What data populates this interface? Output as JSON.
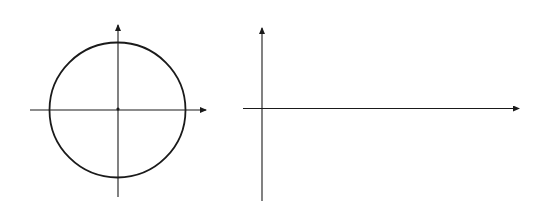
{
  "diagram": {
    "type": "unit-circle-to-wave",
    "colors": {
      "ink": "#1a1a1a",
      "background": "#ffffff"
    },
    "circle": {
      "axis_x_label": "x",
      "axis_y_label": "y",
      "origin_label": "O",
      "x_pos_label": "1",
      "x_neg_label": "-1",
      "y_pos_label": "1",
      "y_neg_label": "-1",
      "radial_angles_deg": [
        105,
        120,
        135,
        150,
        165
      ]
    },
    "wave": {
      "tick_labels": [
        {
          "num": "π",
          "den": "6"
        },
        {
          "num": "π",
          "den": "3"
        },
        {
          "num": "π",
          "den": "2"
        },
        {
          "num": "3π",
          "den": "2"
        },
        {
          "num": "5π",
          "den": "2"
        },
        {
          "num": "π",
          "den": ""
        }
      ]
    }
  }
}
